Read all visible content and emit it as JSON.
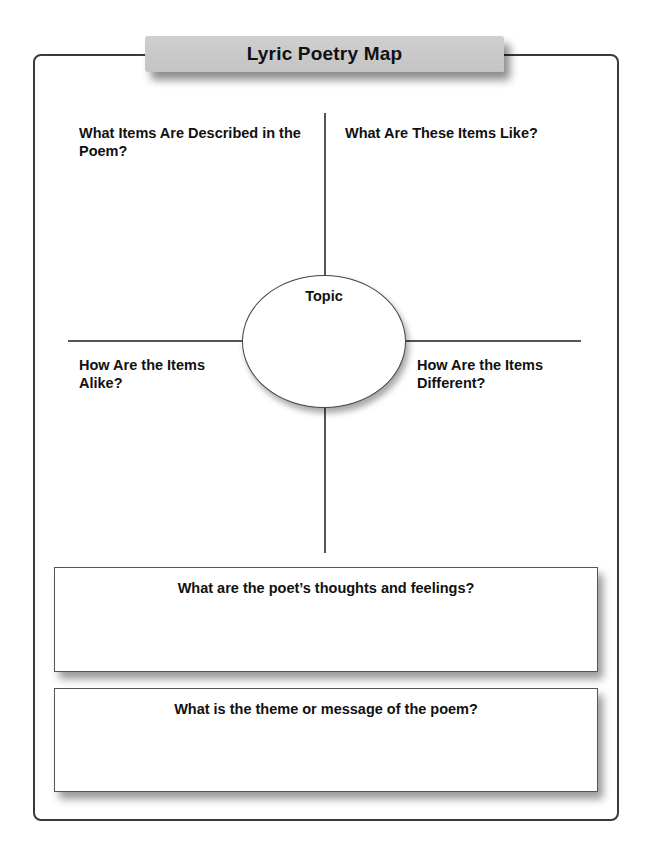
{
  "title": "Lyric Poetry Map",
  "quadrants": {
    "top_left": "What Items Are Described in the Poem?",
    "top_right": "What Are These Items Like?",
    "bottom_left": "How Are the Items Alike?",
    "bottom_right": "How Are the Items Different?"
  },
  "center": {
    "label": "Topic"
  },
  "boxes": [
    {
      "question": "What are the poet’s thoughts and feelings?"
    },
    {
      "question": "What is the theme or message of the poem?"
    }
  ],
  "colors": {
    "title_fill": "#c8c8c8",
    "lines": "#555555",
    "frame": "#3a3a3a"
  }
}
